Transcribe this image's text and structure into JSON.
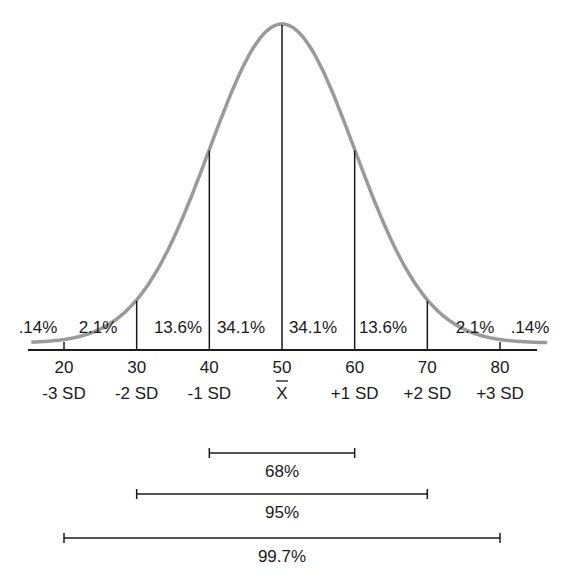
{
  "chart_data": {
    "type": "line",
    "title": "",
    "xlabel": "",
    "ylabel": "",
    "x": [
      20,
      30,
      40,
      50,
      60,
      70,
      80
    ],
    "tick_labels": [
      "20",
      "30",
      "40",
      "50",
      "60",
      "70",
      "80"
    ],
    "sd_labels": [
      "-3 SD",
      "-2 SD",
      "-1 SD",
      "X̅",
      "+1 SD",
      "+2 SD",
      "+3 SD"
    ],
    "mean": 50,
    "sd": 10,
    "region_percentages": [
      ".14%",
      "2.1%",
      "13.6%",
      "34.1%",
      "34.1%",
      "13.6%",
      "2.1%",
      ".14%"
    ],
    "region_values": [
      0.14,
      2.1,
      13.6,
      34.1,
      34.1,
      13.6,
      2.1,
      0.14
    ],
    "intervals": [
      {
        "label": "68%",
        "from": 40,
        "to": 60
      },
      {
        "label": "95%",
        "from": 30,
        "to": 70
      },
      {
        "label": "99.7%",
        "from": 20,
        "to": 80
      }
    ],
    "xlim": [
      16,
      84
    ],
    "grid": false,
    "legend": false
  },
  "colors": {
    "curve": "#9a9a9a",
    "lines": "#1a1a1a"
  }
}
